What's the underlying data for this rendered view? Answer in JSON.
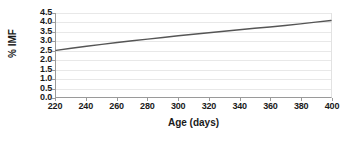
{
  "chart_data": {
    "type": "line",
    "title": "",
    "xlabel": "Age (days)",
    "ylabel": "% IMF",
    "xlim": [
      220,
      400
    ],
    "ylim": [
      0.0,
      4.5
    ],
    "xticks": [
      220,
      240,
      260,
      280,
      300,
      320,
      340,
      360,
      380,
      400
    ],
    "xtick_labels": [
      "220",
      "240",
      "260",
      "280",
      "300",
      "320",
      "340",
      "360",
      "380",
      "400"
    ],
    "yticks": [
      0.0,
      0.5,
      1.0,
      1.5,
      2.0,
      2.5,
      3.0,
      3.5,
      4.0,
      4.5
    ],
    "ytick_labels": [
      "0.0",
      "0.5",
      "1.0",
      "1.5",
      "2.0",
      "2.5",
      "3.0",
      "3.5",
      "4.0",
      "4.5"
    ],
    "grid": "horizontal",
    "legend": "none",
    "series": [
      {
        "name": "% IMF",
        "color": "#555555",
        "linewidth": 1.4,
        "x": [
          220,
          230,
          240,
          250,
          260,
          270,
          280,
          290,
          300,
          310,
          320,
          330,
          340,
          350,
          360,
          370,
          380,
          390,
          400
        ],
        "y": [
          2.5,
          2.61,
          2.72,
          2.82,
          2.92,
          3.01,
          3.1,
          3.19,
          3.28,
          3.36,
          3.44,
          3.52,
          3.6,
          3.68,
          3.75,
          3.83,
          3.92,
          4.01,
          4.1
        ]
      }
    ],
    "colors": {
      "line": "#555555",
      "gridline": "#e8e8e8",
      "axis": "#9a9a9a",
      "plot_border_right": "#e2e2e2",
      "text": "#1a1a1a",
      "background": "#ffffff"
    }
  }
}
